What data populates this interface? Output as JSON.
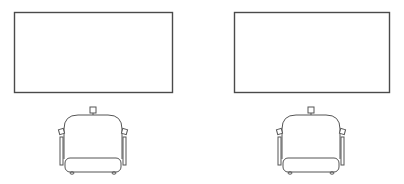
{
  "canvas": {
    "width": 404,
    "height": 184,
    "background": "#ffffff",
    "line_color": "#555555"
  },
  "stations": [
    {
      "id": "left",
      "table": {
        "x": 14,
        "y": 12,
        "width": 158,
        "height": 80
      },
      "chair": {
        "cx": 93,
        "top": 107
      }
    },
    {
      "id": "right",
      "table": {
        "x": 234,
        "y": 12,
        "width": 155,
        "height": 80
      },
      "chair": {
        "cx": 311,
        "top": 107
      }
    }
  ]
}
